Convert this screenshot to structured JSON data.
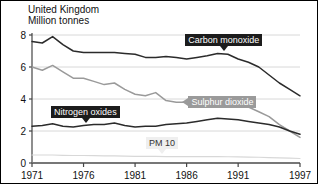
{
  "header": {
    "title": "United Kingdom",
    "subtitle": "Million tonnes"
  },
  "axes": {
    "y_ticks": [
      "0",
      "2",
      "4",
      "6",
      "8"
    ],
    "x_ticks": [
      "1971",
      "1976",
      "1981",
      "1986",
      "1991",
      "1997"
    ]
  },
  "annotations": {
    "carbon_monoxide": "Carbon monoxide",
    "sulphur_dioxide": "Sulphur dioxide",
    "nitrogen_oxides": "Nitrogen oxides",
    "pm10": "PM 10"
  },
  "colors": {
    "carbon_monoxide": "#2b2b2b",
    "sulphur_dioxide": "#9a9a9a",
    "nitrogen_oxides": "#2b2b2b",
    "pm10": "#d8d8d8",
    "grid": "#d8d8d8",
    "axis": "#555555"
  },
  "chart_data": {
    "type": "line",
    "title": "United Kingdom",
    "subtitle": "Million tonnes",
    "xlabel": "",
    "ylabel": "Million tonnes",
    "xlim": [
      1971,
      1997
    ],
    "ylim": [
      0,
      8
    ],
    "y_ticks": [
      0,
      2,
      4,
      6,
      8
    ],
    "x_ticks": [
      1971,
      1976,
      1981,
      1986,
      1991,
      1997
    ],
    "grid": "horizontal",
    "legend": "inline-callouts",
    "x": [
      1971,
      1972,
      1973,
      1974,
      1975,
      1976,
      1977,
      1978,
      1979,
      1980,
      1981,
      1982,
      1983,
      1984,
      1985,
      1986,
      1987,
      1988,
      1989,
      1990,
      1991,
      1992,
      1993,
      1994,
      1995,
      1996,
      1997
    ],
    "series": [
      {
        "name": "Carbon monoxide",
        "color": "#2b2b2b",
        "values": [
          7.6,
          7.5,
          7.9,
          7.4,
          7.0,
          6.9,
          6.9,
          6.9,
          6.9,
          6.85,
          6.8,
          6.6,
          6.6,
          6.65,
          6.6,
          6.5,
          6.6,
          6.7,
          6.85,
          6.8,
          6.5,
          6.3,
          6.0,
          5.5,
          5.0,
          4.6,
          4.2
        ]
      },
      {
        "name": "Sulphur dioxide",
        "color": "#9a9a9a",
        "values": [
          6.0,
          5.8,
          6.1,
          5.7,
          5.3,
          5.3,
          5.1,
          4.9,
          5.0,
          4.6,
          4.3,
          4.2,
          4.4,
          3.9,
          3.8,
          3.8,
          3.8,
          3.8,
          3.8,
          3.7,
          3.6,
          3.5,
          3.2,
          2.9,
          2.4,
          2.0,
          1.6
        ]
      },
      {
        "name": "Nitrogen oxides",
        "color": "#2b2b2b",
        "values": [
          2.3,
          2.35,
          2.45,
          2.3,
          2.25,
          2.35,
          2.4,
          2.4,
          2.5,
          2.35,
          2.25,
          2.3,
          2.3,
          2.4,
          2.45,
          2.5,
          2.6,
          2.7,
          2.8,
          2.75,
          2.7,
          2.6,
          2.5,
          2.4,
          2.25,
          2.0,
          1.8
        ]
      },
      {
        "name": "PM 10",
        "color": "#d8d8d8",
        "values": [
          0.5,
          0.5,
          0.5,
          0.48,
          0.47,
          0.47,
          0.46,
          0.45,
          0.45,
          0.43,
          0.42,
          0.41,
          0.41,
          0.4,
          0.4,
          0.4,
          0.4,
          0.4,
          0.4,
          0.39,
          0.38,
          0.37,
          0.36,
          0.34,
          0.32,
          0.3,
          0.28
        ]
      }
    ]
  }
}
